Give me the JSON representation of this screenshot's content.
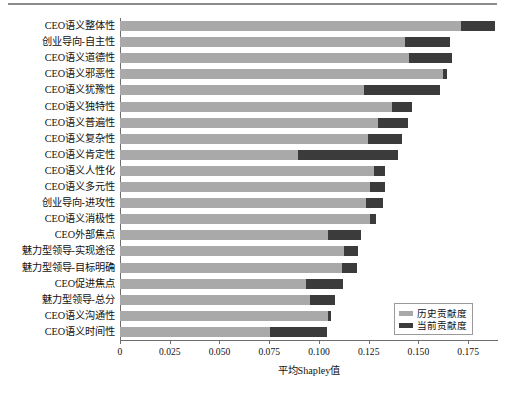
{
  "chart_data": {
    "type": "bar",
    "orientation": "horizontal",
    "stacked": true,
    "title": "",
    "xlabel": "平均Shapley值",
    "ylabel": "",
    "xlim": [
      0,
      0.19
    ],
    "xticks": [
      0,
      0.025,
      0.05,
      0.075,
      0.1,
      0.125,
      0.15,
      0.175
    ],
    "xtick_labels": [
      "0",
      "0.025",
      "0.050",
      "0.075",
      "0.100",
      "0.125",
      "0.150",
      "0.175"
    ],
    "grid": false,
    "legend_position": "lower right",
    "categories": [
      "CEO语义整体性",
      "创业导向-自主性",
      "CEO语义道德性",
      "CEO语义邪恶性",
      "CEO语义犹豫性",
      "CEO语义独特性",
      "CEO语义普遍性",
      "CEO语义复杂性",
      "CEO语义肯定性",
      "CEO语义人性化",
      "CEO语义多元性",
      "创业导向-进攻性",
      "CEO语义消极性",
      "CEO外部焦点",
      "魅力型领导-实现途径",
      "魅力型领导-目标明确",
      "CEO促进焦点",
      "魅力型领导-总分",
      "CEO语义沟通性",
      "CEO语义时间性"
    ],
    "series": [
      {
        "name": "历史贡献度",
        "color": "#a9a9a9",
        "values": [
          0.1715,
          0.1435,
          0.1455,
          0.1625,
          0.1225,
          0.1365,
          0.1295,
          0.1245,
          0.0895,
          0.1275,
          0.1255,
          0.1235,
          0.1255,
          0.1045,
          0.1125,
          0.1115,
          0.0935,
          0.0955,
          0.1045,
          0.0755
        ]
      },
      {
        "name": "当前贡献度",
        "color": "#3b3b3b",
        "values": [
          0.017,
          0.0225,
          0.0215,
          0.002,
          0.0385,
          0.0105,
          0.0155,
          0.017,
          0.05,
          0.0055,
          0.0075,
          0.0085,
          0.003,
          0.0165,
          0.007,
          0.0075,
          0.0185,
          0.0125,
          0.0015,
          0.0285
        ]
      }
    ],
    "totals": [
      0.1885,
      0.166,
      0.167,
      0.1645,
      0.161,
      0.147,
      0.145,
      0.1415,
      0.1395,
      0.133,
      0.133,
      0.132,
      0.1285,
      0.121,
      0.1195,
      0.119,
      0.112,
      0.108,
      0.106,
      0.104
    ]
  },
  "legend": {
    "items": [
      {
        "label": "历史贡献度",
        "color": "#a9a9a9"
      },
      {
        "label": "当前贡献度",
        "color": "#3b3b3b"
      }
    ]
  },
  "caption": ""
}
